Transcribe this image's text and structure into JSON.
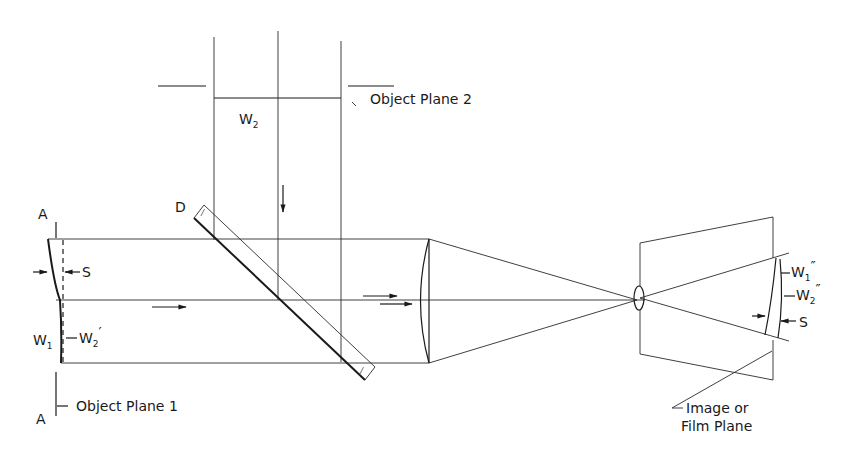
{
  "diagram": {
    "type": "optical-schematic",
    "labels": {
      "object_plane_1": "Object Plane 1",
      "object_plane_2": "Object Plane 2",
      "image_plane_line1": "Image or",
      "image_plane_line2": "Film Plane",
      "plane_a_top": "A",
      "plane_a_bottom": "A",
      "beamsplitter": "D",
      "w1": "W",
      "w1_sub": "1",
      "w2": "W",
      "w2_sub": "2",
      "w2_prime": "W",
      "w2_prime_sub": "2",
      "w2_prime_mark": "′",
      "w1_dprime": "W",
      "w1_dprime_sub": "1",
      "w1_dprime_mark": "″",
      "w2_dprime": "W",
      "w2_dprime_sub": "2",
      "w2_dprime_mark": "″",
      "s_left": "S",
      "s_right": "S"
    },
    "colors": {
      "line": "#1a1a1a",
      "background": "#ffffff"
    }
  }
}
